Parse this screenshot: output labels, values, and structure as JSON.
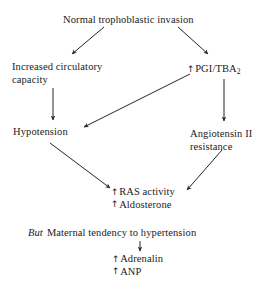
{
  "diagram": {
    "type": "flowchart",
    "background_color": "#ffffff",
    "text_color": "#1a1a1a",
    "arrow_color": "#262626",
    "nodes": {
      "title": {
        "text": "Normal trophoblastic invasion"
      },
      "increased_capacity": {
        "line1": "Increased  circulatory",
        "line2": "capacity"
      },
      "pgi_tba": {
        "arrow": "↑",
        "label": "PGI/TBA",
        "subscript": "2"
      },
      "hypotension": {
        "text": "Hypotension"
      },
      "angiotensin": {
        "line1": "Angiotensin II",
        "line2": "resistance"
      },
      "ras": {
        "arrow1": "↑",
        "line1": "RAS activity",
        "arrow2": "↑",
        "line2": "Aldosterone"
      },
      "maternal": {
        "prefix": "But",
        "text": "Maternal  tendency  to  hypertension"
      },
      "adrenalin": {
        "arrow1": "↑",
        "line1": "Adrenalin",
        "arrow2": "↑",
        "line2": "ANP"
      }
    },
    "edges": [
      {
        "from": "title",
        "to": "increased_capacity",
        "style": "diagonal-down-left"
      },
      {
        "from": "title",
        "to": "pgi_tba",
        "style": "diagonal-down-right"
      },
      {
        "from": "increased_capacity",
        "to": "hypotension",
        "style": "vertical-down"
      },
      {
        "from": "pgi_tba",
        "to": "angiotensin",
        "style": "vertical-down"
      },
      {
        "from": "pgi_tba",
        "to": "hypotension",
        "style": "diagonal-down-left-long"
      },
      {
        "from": "hypotension",
        "to": "ras",
        "style": "diagonal-down-right"
      },
      {
        "from": "angiotensin",
        "to": "ras",
        "style": "diagonal-down-left"
      },
      {
        "from": "maternal",
        "to": "adrenalin",
        "style": "vertical-down-short"
      }
    ]
  }
}
